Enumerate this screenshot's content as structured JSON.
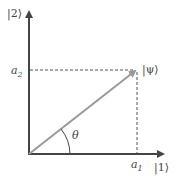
{
  "diagram": {
    "y_axis_label": "|2⟩",
    "x_axis_label": "|1⟩",
    "vector_label": "|ψ⟩",
    "angle_label": "θ",
    "y_component": {
      "base": "a",
      "sub": "2"
    },
    "x_component": {
      "base": "a",
      "sub": "1"
    },
    "colors": {
      "axes": "#444444",
      "vector": "#999999",
      "dashed": "#555555"
    }
  }
}
